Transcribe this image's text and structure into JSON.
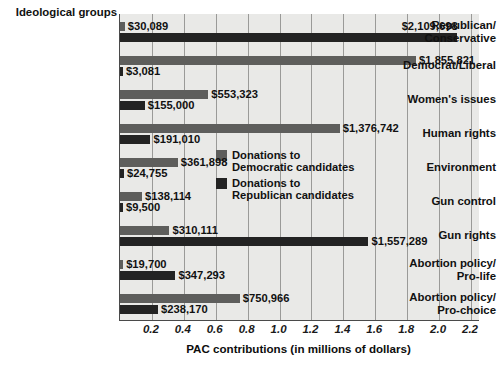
{
  "chart_data": {
    "type": "bar",
    "orientation": "horizontal",
    "title": "",
    "group_axis_title": "Ideological groups",
    "xlabel": "PAC contributions (in millions of dollars)",
    "ylabel": "",
    "xlim": [
      0,
      2.25
    ],
    "xticks": [
      "0.2",
      "0.4",
      "0.6",
      "0.8",
      "1.0",
      "1.2",
      "1.4",
      "1.6",
      "1.8",
      "2.0",
      "2.2"
    ],
    "xtick_values": [
      0.2,
      0.4,
      0.6,
      0.8,
      1.0,
      1.2,
      1.4,
      1.6,
      1.8,
      2.0,
      2.2
    ],
    "grid": true,
    "legend_position": "inside-right-middle",
    "categories": [
      "Republican/\nConservative",
      "Democrat/Liberal",
      "Women's issues",
      "Human rights",
      "Environment",
      "Gun control",
      "Gun rights",
      "Abortion policy/\nPro-life",
      "Abortion policy/\nPro-choice"
    ],
    "series": [
      {
        "name": "Donations to Democratic candidates",
        "color": "#5e5e5c",
        "values": [
          0.030089,
          1.855821,
          0.553323,
          1.376742,
          0.361898,
          0.138114,
          0.310111,
          0.0197,
          0.750966
        ],
        "labels": [
          "$30,089",
          "$1,855,821",
          "$553,323",
          "$1,376,742",
          "$361,898",
          "$138,114",
          "$310,111",
          "$19,700",
          "$750,966"
        ]
      },
      {
        "name": "Donations to Republican candidates",
        "color": "#232323",
        "values": [
          2.109698,
          0.003081,
          0.155,
          0.19101,
          0.024755,
          0.0095,
          1.557289,
          0.347293,
          0.23817
        ],
        "labels": [
          "$2,109,698",
          "$3,081",
          "$155,000",
          "$191,010",
          "$24,755",
          "$9,500",
          "$1,557,289",
          "$347,293",
          "$238,170"
        ]
      }
    ]
  },
  "legend": {
    "items": [
      {
        "label": "Donations to\nDemocratic candidates",
        "color": "#5e5e5c",
        "swatch_name": "legend-swatch-democratic"
      },
      {
        "label": "Donations to\nRepublican candidates",
        "color": "#232323",
        "swatch_name": "legend-swatch-republican"
      }
    ]
  }
}
